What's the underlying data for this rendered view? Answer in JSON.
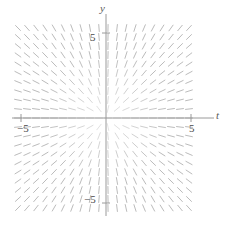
{
  "figure": {
    "kind": "slope-field"
  },
  "axes": {
    "x_axis_label": "t",
    "y_axis_label": "y",
    "ticks": {
      "x_negative": "−5",
      "x_positive": "5",
      "y_positive": "5",
      "y_negative": "−5"
    },
    "axis_color": "#9a9a9a",
    "tick_color": "#9a9a9a"
  },
  "colors": {
    "background": "#ffffff",
    "slope_mark": "#b8b8b8",
    "axis": "#9a9a9a",
    "label_text": "#4a4a4a"
  },
  "chart_data": {
    "type": "scatter",
    "title": "",
    "xlabel": "t",
    "ylabel": "y",
    "xlim": [
      -7.2,
      6.6
    ],
    "ylim": [
      -6.6,
      7.0
    ],
    "grid": false,
    "legend": null,
    "xticks": [
      -5,
      5
    ],
    "yticks": [
      -5,
      5
    ],
    "xticklabels": [
      "−5",
      "5"
    ],
    "yticklabels": [
      "−5",
      "5"
    ],
    "slope_field": {
      "equation": "dy/dt = y / t",
      "origin_px": [
        106,
        118
      ],
      "pixels_per_unit": 17.0,
      "mark_spacing_px": 9.0,
      "mark_length_px": 7.0,
      "field_bounds_px": {
        "left": 18,
        "right": 196,
        "top": 28,
        "bottom": 210
      },
      "note": "Tick marks align radially with lines through the origin; slope at point (t,y) equals y/t."
    }
  }
}
